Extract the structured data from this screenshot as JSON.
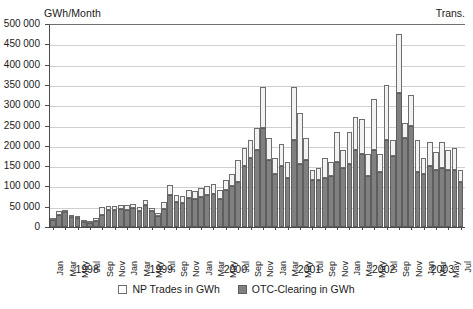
{
  "figure": {
    "unit_label": "GWh/Month",
    "corner_label": "Trans."
  },
  "legend": {
    "position": "bottom-center",
    "items": [
      {
        "label": "NP Trades in GWh",
        "color": "#ffffff",
        "swatch": "np"
      },
      {
        "label": "OTC-Clearing in GWh",
        "color": "#808080",
        "swatch": "otc"
      }
    ]
  },
  "chart_data": {
    "type": "bar",
    "stacked": true,
    "title": "",
    "subtitle": "",
    "xlabel": "",
    "ylabel": "GWh/Month",
    "corner_annotation": "Trans.",
    "ylim": [
      0,
      500000
    ],
    "ytick_step": 50000,
    "grid": true,
    "ytick_labels": [
      "0",
      "50 000",
      "100 000",
      "150 000",
      "200 000",
      "250 000",
      "300 000",
      "350 000",
      "400 000",
      "450 000",
      "500 000"
    ],
    "ytick_values": [
      0,
      50000,
      100000,
      150000,
      200000,
      250000,
      300000,
      350000,
      400000,
      450000,
      500000
    ],
    "xtick_labels": [
      "Jan",
      "Mar",
      "May",
      "Jul",
      "Sep",
      "Nov",
      "Jan",
      "Mar",
      "May",
      "Jul",
      "Sep",
      "Nov",
      "Jan",
      "Mar",
      "May",
      "Jul",
      "Sep",
      "Nov",
      "Jan",
      "Mar",
      "May",
      "Jul",
      "Sep",
      "Nov",
      "Jan",
      "Mar",
      "May",
      "Jul",
      "Sep",
      "Nov",
      "Jan",
      "Mar",
      "May",
      "Jul"
    ],
    "xtick_indices": [
      0,
      2,
      4,
      6,
      8,
      10,
      12,
      14,
      16,
      18,
      20,
      22,
      24,
      26,
      28,
      30,
      32,
      34,
      36,
      38,
      40,
      42,
      44,
      46,
      48,
      50,
      52,
      54,
      56,
      58,
      60,
      62,
      64,
      66
    ],
    "year_groups": [
      {
        "label": "1998",
        "start_index": 0,
        "end_index": 11
      },
      {
        "label": "1999",
        "start_index": 12,
        "end_index": 23
      },
      {
        "label": "2000",
        "start_index": 24,
        "end_index": 35
      },
      {
        "label": "2001",
        "start_index": 36,
        "end_index": 47
      },
      {
        "label": "2002",
        "start_index": 48,
        "end_index": 59
      },
      {
        "label": "2003",
        "start_index": 60,
        "end_index": 66
      }
    ],
    "categories": [
      "Jan 1998",
      "Feb 1998",
      "Mar 1998",
      "Apr 1998",
      "May 1998",
      "Jun 1998",
      "Jul 1998",
      "Aug 1998",
      "Sep 1998",
      "Oct 1998",
      "Nov 1998",
      "Dec 1998",
      "Jan 1999",
      "Feb 1999",
      "Mar 1999",
      "Apr 1999",
      "May 1999",
      "Jun 1999",
      "Jul 1999",
      "Aug 1999",
      "Sep 1999",
      "Oct 1999",
      "Nov 1999",
      "Dec 1999",
      "Jan 2000",
      "Feb 2000",
      "Mar 2000",
      "Apr 2000",
      "May 2000",
      "Jun 2000",
      "Jul 2000",
      "Aug 2000",
      "Sep 2000",
      "Oct 2000",
      "Nov 2000",
      "Dec 2000",
      "Jan 2001",
      "Feb 2001",
      "Mar 2001",
      "Apr 2001",
      "May 2001",
      "Jun 2001",
      "Jul 2001",
      "Aug 2001",
      "Sep 2001",
      "Oct 2001",
      "Nov 2001",
      "Dec 2001",
      "Jan 2002",
      "Feb 2002",
      "Mar 2002",
      "Apr 2002",
      "May 2002",
      "Jun 2002",
      "Jul 2002",
      "Aug 2002",
      "Sep 2002",
      "Oct 2002",
      "Nov 2002",
      "Dec 2002",
      "Jan 2003",
      "Feb 2003",
      "Mar 2003",
      "Apr 2003",
      "May 2003",
      "Jun 2003",
      "Jul 2003"
    ],
    "series": [
      {
        "name": "OTC-Clearing in GWh",
        "color": "#808080",
        "values": [
          18000,
          30000,
          36000,
          25000,
          22000,
          12000,
          10000,
          14000,
          30000,
          42000,
          42000,
          44000,
          42000,
          46000,
          40000,
          55000,
          40000,
          28000,
          44000,
          78000,
          62000,
          58000,
          72000,
          70000,
          75000,
          80000,
          82000,
          68000,
          90000,
          100000,
          110000,
          150000,
          170000,
          190000,
          245000,
          165000,
          130000,
          150000,
          120000,
          215000,
          155000,
          165000,
          115000,
          115000,
          120000,
          125000,
          160000,
          145000,
          155000,
          190000,
          180000,
          125000,
          190000,
          135000,
          215000,
          175000,
          330000,
          220000,
          250000,
          135000,
          130000,
          150000,
          140000,
          145000,
          140000,
          140000,
          110000
        ]
      },
      {
        "name": "NP Trades in GWh",
        "color": "#ffffff",
        "values": [
          5000,
          10000,
          6000,
          5000,
          4000,
          5000,
          6000,
          8000,
          20000,
          10000,
          10000,
          10000,
          12000,
          10000,
          10000,
          12000,
          8000,
          6000,
          18000,
          25000,
          18000,
          18000,
          20000,
          18000,
          20000,
          22000,
          25000,
          22000,
          25000,
          30000,
          55000,
          45000,
          45000,
          55000,
          100000,
          55000,
          40000,
          55000,
          40000,
          130000,
          125000,
          55000,
          25000,
          30000,
          50000,
          35000,
          75000,
          45000,
          80000,
          80000,
          85000,
          55000,
          125000,
          45000,
          135000,
          40000,
          145000,
          35000,
          75000,
          80000,
          40000,
          60000,
          45000,
          65000,
          50000,
          55000,
          30000
        ]
      }
    ]
  }
}
